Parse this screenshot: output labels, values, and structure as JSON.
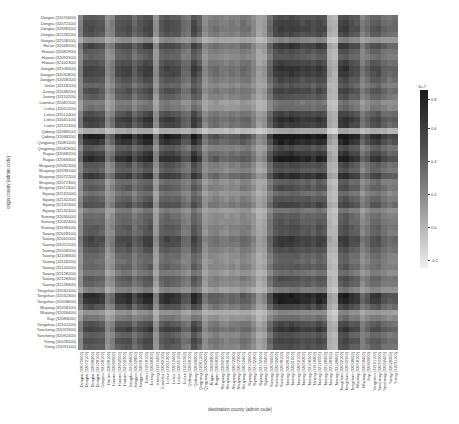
{
  "chart_data": {
    "type": "heatmap",
    "title": "",
    "xlabel": "destination county (admin code)",
    "ylabel": "origin county (admin code)",
    "colorbar": {
      "exponent_label": "1e-7",
      "ticks": [
        0.8,
        0.6,
        0.4,
        0.2,
        0.0,
        -0.2
      ],
      "tick_labels": [
        "0.8",
        "0.6",
        "0.4",
        "0.2",
        "0.0",
        "-0.2"
      ],
      "colormap": "greys (dark = high, light = low)"
    },
    "rows": [
      "Dongtai (32070600)",
      "Dongtai (32072100)",
      "Dongtai (32098200)",
      "Dongtai (32128100)",
      "Gaoyou (32108100)",
      "Hai'an (32068100)",
      "Huaian (32082900)",
      "Huaian (32092500)",
      "Huaian (32102300)",
      "Jiangdu (32108400)",
      "Jiangyin (32032800)",
      "Jiangyin (32058100)",
      "Jinlan (32118100)",
      "Jurong (32048200)",
      "Jurong (32110200)",
      "Lianshui (32082100)",
      "Lishui (32011200)",
      "Lishui (32012400)",
      "Lishui (32045100)",
      "Lishui (32115300)",
      "Qidong (32068100)",
      "Qidong (32068200)",
      "Qingjiang (32081100)",
      "Qingjiang (32082600)",
      "Rugao (32068200)",
      "Rugao (32068300)",
      "Shuyang (32082300)",
      "Shuyang (32098100)",
      "Shuyang (32072200)",
      "Shuyang (32072300)",
      "Shuyang (32072400)",
      "Siyang (32132000)",
      "Siyang (32132200)",
      "Siyang (32132300)",
      "Siyang (32132400)",
      "Suining (32030000)",
      "Suining (32032400)",
      "Suining (32038100)",
      "Taixing (32028100)",
      "Taixing (32041000)",
      "Taixing (32052100)",
      "Taixing (32058200)",
      "Taixing (32108300)",
      "Taixing (32118200)",
      "Taixing (32120500)",
      "Taixing (32128200)",
      "Taixing (32128300)",
      "Taixing (32128400)",
      "Tongshan (32032100)",
      "Tongshan (32032300)",
      "Tongshan (32058600)",
      "Wujiang (32058100)",
      "Wujiang (32058400)",
      "Xuyi (32083000)",
      "Yangzhou (32101100)",
      "Yancheng (32093300)",
      "Yancheng (32092400)",
      "Yixing (32028200)",
      "Yixing (32031100)"
    ],
    "columns": [
      "Dongtai (32070600)",
      "Dongtai (32072100)",
      "Dongtai (32098200)",
      "Dongtai (32128100)",
      "Gaoyou (32108100)",
      "Hai'an (32068100)",
      "Huaian (32082900)",
      "Huaian (32092500)",
      "Huaian (32102300)",
      "Jiangdu (32108400)",
      "Jiangyin (32032800)",
      "Jiangyin (32058100)",
      "Jinlan (32118100)",
      "Jurong (32048200)",
      "Jurong (32110200)",
      "Lianshui (32082100)",
      "Lishui (32011200)",
      "Lishui (32012400)",
      "Lishui (32045100)",
      "Lishui (32115300)",
      "Qidong (32068100)",
      "Qidong (32068200)",
      "Qingjiang (32081100)",
      "Qingjiang (32082600)",
      "Rugao (32068200)",
      "Rugao (32068300)",
      "Shuyang (32082300)",
      "Shuyang (32098100)",
      "Shuyang (32072200)",
      "Shuyang (32072300)",
      "Shuyang (32072400)",
      "Siyang (32132000)",
      "Siyang (32132200)",
      "Siyang (32132300)",
      "Siyang (32132400)",
      "Suining (32030000)",
      "Suining (32032400)",
      "Suining (32038100)",
      "Taixing (32028100)",
      "Taixing (32041000)",
      "Taixing (32052100)",
      "Taixing (32058200)",
      "Taixing (32108300)",
      "Taixing (32118200)",
      "Taixing (32120500)",
      "Taixing (32128200)",
      "Taixing (32128300)",
      "Taixing (32128400)",
      "Tongshan (32032100)",
      "Tongshan (32032300)",
      "Tongshan (32058600)",
      "Wujiang (32058100)",
      "Wujiang (32058400)",
      "Xuyi (32083000)",
      "Yangzhou (32101100)",
      "Yancheng (32093300)",
      "Yancheng (32092400)",
      "Yixing (32028200)",
      "Yixing (32031100)"
    ],
    "row_intensity": [
      0.62,
      0.66,
      0.68,
      0.64,
      0.42,
      0.7,
      0.62,
      0.58,
      0.66,
      0.72,
      0.7,
      0.64,
      0.58,
      0.66,
      0.6,
      0.48,
      0.52,
      0.66,
      0.74,
      0.7,
      0.3,
      0.86,
      0.78,
      0.62,
      0.72,
      0.8,
      0.64,
      0.6,
      0.74,
      0.56,
      0.62,
      0.52,
      0.6,
      0.66,
      0.48,
      0.56,
      0.58,
      0.62,
      0.6,
      0.7,
      0.68,
      0.62,
      0.56,
      0.54,
      0.58,
      0.5,
      0.62,
      0.58,
      0.46,
      0.8,
      0.78,
      0.66,
      0.4,
      0.5,
      0.64,
      0.72,
      0.6,
      0.66,
      0.62
    ],
    "col_intensity": [
      0.5,
      0.72,
      0.74,
      0.72,
      0.7,
      0.46,
      0.52,
      0.7,
      0.72,
      0.74,
      0.62,
      0.7,
      0.76,
      0.78,
      0.44,
      0.7,
      0.74,
      0.72,
      0.7,
      0.6,
      0.58,
      0.76,
      0.68,
      0.46,
      0.54,
      0.56,
      0.52,
      0.5,
      0.54,
      0.52,
      0.58,
      0.56,
      0.48,
      0.36,
      0.4,
      0.62,
      0.76,
      0.8,
      0.78,
      0.8,
      0.78,
      0.74,
      0.76,
      0.72,
      0.78,
      0.74,
      0.32,
      0.28,
      0.76,
      0.8,
      0.72,
      0.7,
      0.52,
      0.6,
      0.68,
      0.7,
      0.62,
      0.58,
      0.6
    ]
  },
  "colorbar_labels": {
    "exp": "1e-7",
    "t0": "0.8",
    "t1": "0.6",
    "t2": "0.4",
    "t3": "0.2",
    "t4": "0.0",
    "t5": "-0.2"
  }
}
